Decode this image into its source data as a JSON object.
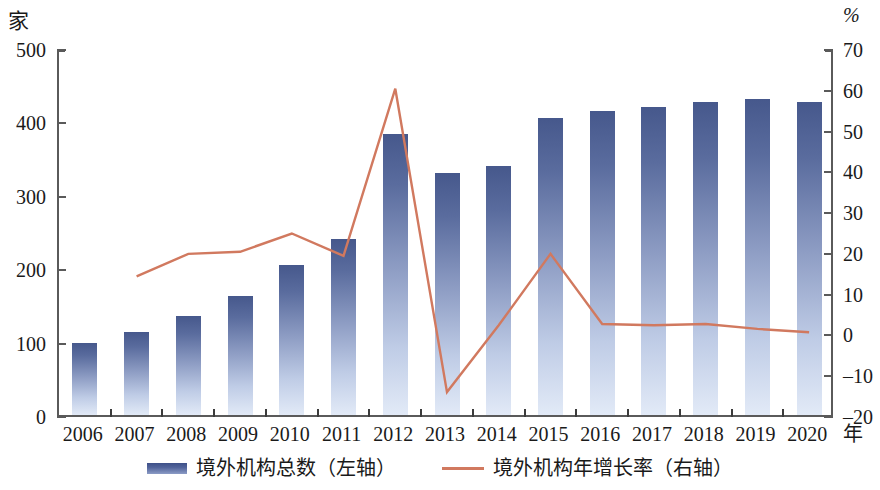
{
  "axes": {
    "left_unit": "家",
    "right_unit": "%",
    "x_unit": "年",
    "left_ticks": [
      "500",
      "400",
      "300",
      "200",
      "100",
      "0"
    ],
    "right_ticks": [
      "70",
      "60",
      "50",
      "40",
      "30",
      "20",
      "10",
      "0",
      "-10",
      "-20"
    ],
    "x_ticks": [
      "2006",
      "2007",
      "2008",
      "2009",
      "2010",
      "2011",
      "2012",
      "2013",
      "2014",
      "2015",
      "2016",
      "2017",
      "2018",
      "2019",
      "2020"
    ]
  },
  "legend": {
    "items": [
      {
        "label": "境外机构总数（左轴）",
        "marker": "bar-swatch",
        "color": "#46588c"
      },
      {
        "label": "境外机构年增长率（右轴）",
        "marker": "line-swatch",
        "color": "#d1795f"
      }
    ]
  },
  "chart_data": {
    "type": "bar",
    "title": "",
    "xlabel": "年",
    "ylabel": "家",
    "y2label": "%",
    "categories": [
      "2006",
      "2007",
      "2008",
      "2009",
      "2010",
      "2011",
      "2012",
      "2013",
      "2014",
      "2015",
      "2016",
      "2017",
      "2018",
      "2019",
      "2020"
    ],
    "ylim": [
      0,
      500
    ],
    "y2lim": [
      -20,
      70
    ],
    "grid": false,
    "legend_position": "bottom",
    "series": [
      {
        "name": "境外机构总数（左轴）",
        "type": "bar",
        "axis": "left",
        "unit": "家",
        "color": "#46588c",
        "values": [
          98,
          113,
          135,
          162,
          204,
          240,
          383,
          330,
          339,
          405,
          414,
          420,
          427,
          430,
          427
        ]
      },
      {
        "name": "境外机构年增长率（右轴）",
        "type": "line",
        "axis": "right",
        "unit": "%",
        "color": "#d1795f",
        "x": [
          "2007",
          "2008",
          "2009",
          "2010",
          "2011",
          "2012",
          "2013",
          "2014",
          "2015",
          "2016",
          "2017",
          "2018",
          "2019",
          "2020"
        ],
        "values": [
          14.5,
          20.0,
          20.5,
          25.0,
          19.5,
          60.5,
          -13.9,
          2.5,
          20.0,
          2.8,
          2.5,
          2.8,
          1.6,
          0.8
        ]
      }
    ]
  }
}
